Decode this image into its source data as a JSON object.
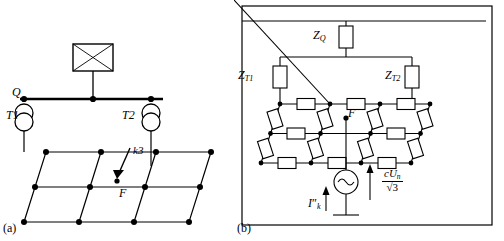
{
  "figure": {
    "panel_a": {
      "caption": "(a)",
      "labels": {
        "node_q": "Q",
        "transformer_1": "T1",
        "transformer_2": "T2",
        "fault_type": "k3",
        "fault_point": "F"
      }
    },
    "panel_b": {
      "caption": "(b)",
      "labels": {
        "z_q": "Z",
        "z_q_sub": "Q",
        "z_t1": "Z",
        "z_t1_sub": "T1",
        "z_t2": "Z",
        "z_t2_sub": "T2",
        "fault_point": "F",
        "source_num_c": "c",
        "source_num_u": "U",
        "source_num_u_sub": "n",
        "source_den": "3",
        "source_den_radical": "√",
        "fault_current": "I",
        "fault_current_sub": "k",
        "fault_current_prime": "″"
      }
    },
    "colors": {
      "line": "#000000",
      "background": "#ffffff"
    }
  }
}
